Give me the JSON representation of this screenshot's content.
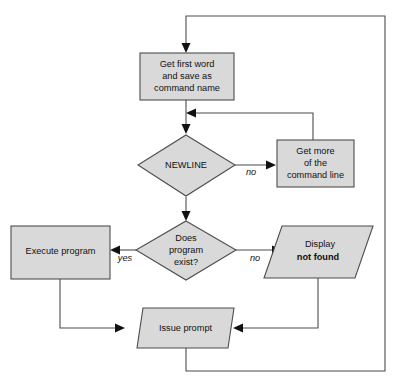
{
  "diagram": {
    "canvas": {
      "width": 396,
      "height": 386,
      "background": "#ffffff"
    },
    "style": {
      "node_fill": "#d9d9d9",
      "node_stroke": "#4d4d4d",
      "connector_stroke": "#4d4d4d",
      "arrow_fill": "#111111",
      "text_color": "#111111"
    },
    "nodes": [
      {
        "id": "get-first-word",
        "shape": "process",
        "lines": [
          "Get first word",
          "and save as",
          "command name"
        ]
      },
      {
        "id": "newline-decision",
        "shape": "decision",
        "lines": [
          "NEWLINE"
        ]
      },
      {
        "id": "get-more-command-line",
        "shape": "process",
        "lines": [
          "Get more",
          "of the",
          "command line"
        ]
      },
      {
        "id": "program-exists-decision",
        "shape": "decision",
        "lines": [
          "Does",
          "program",
          "exist?"
        ]
      },
      {
        "id": "execute-program",
        "shape": "process",
        "lines": [
          "Execute program"
        ]
      },
      {
        "id": "display-not-found",
        "shape": "io-parallelogram",
        "lines": [
          "Display",
          "not found"
        ],
        "bold_lines": [
          "not found"
        ]
      },
      {
        "id": "issue-prompt",
        "shape": "io-parallelogram",
        "lines": [
          "Issue prompt"
        ]
      }
    ],
    "edge_labels": {
      "newline_no": "no",
      "exists_yes": "yes",
      "exists_no": "no"
    }
  }
}
